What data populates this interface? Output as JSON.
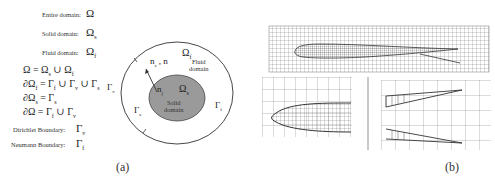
{
  "panel_a": {
    "caption": "(a)",
    "legend": [
      {
        "label": "Entire domain:",
        "symbol": "Ω"
      },
      {
        "label": "Solid domain:",
        "symbol": "Ωs"
      },
      {
        "label": "Fluid domain:",
        "symbol": "Ωf"
      }
    ],
    "equations": [
      "Ω = Ωs ∪ Ωf",
      "∂Ωf = Γf ∪ Γv ∪ Γs",
      "∂Ωs = Γs",
      "∂Ω = Γf ∪ Γv"
    ],
    "boundaries": [
      {
        "label": "Dirichlet Boundary:",
        "symbol": "Γv"
      },
      {
        "label": "Neumann Boundary:",
        "symbol": "Γf"
      }
    ],
    "diagram": {
      "omega_f": "Ωf",
      "fluid_label_1": "Fluid",
      "fluid_label_2": "domain",
      "omega_s": "Ωs",
      "solid_label_1": "Solid",
      "solid_label_2": "domain",
      "normal_outer": "ns , n",
      "normal_inner": "nf",
      "gamma_v": "Γv",
      "gamma_s": "Γs",
      "gamma_f": "Γf",
      "colors": {
        "solid_fill": "#9a9a9a",
        "line": "#333333"
      }
    }
  },
  "panel_b": {
    "caption": "(b)",
    "views": [
      "full-wing-mesh",
      "leading-edge-zoom",
      "trailing-edge-zoom"
    ]
  }
}
